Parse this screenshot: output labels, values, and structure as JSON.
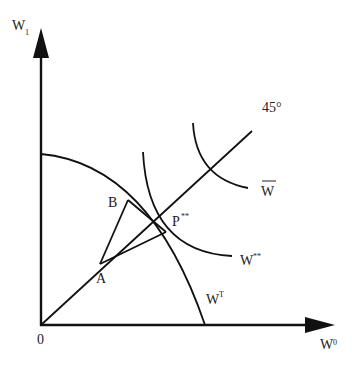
{
  "diagram": {
    "axes": {
      "y_label": "W",
      "y_sub": "1",
      "x_label": "W",
      "x_sub": "0",
      "origin_label": "0"
    },
    "line_45": {
      "label": "45°"
    },
    "points": {
      "A": "A",
      "B": "B",
      "P": "P",
      "P_sup": "**"
    },
    "curves": {
      "w_bar": {
        "label": "W"
      },
      "w_star": {
        "label": "W",
        "sup": "**"
      },
      "w_t": {
        "label": "W",
        "sup": "T"
      }
    },
    "colors": {
      "line": "#111111",
      "background": "#ffffff"
    }
  }
}
